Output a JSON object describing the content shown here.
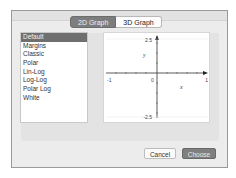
{
  "tabs": [
    {
      "label": "2D Graph",
      "active": true
    },
    {
      "label": "3D Graph",
      "active": false
    }
  ],
  "templates": {
    "selected": "Default",
    "items": [
      "Default",
      "Margins",
      "Classic",
      "Polar",
      "Lin-Log",
      "Log-Log",
      "Polar Log",
      "White"
    ]
  },
  "preview": {
    "x_label": "x",
    "y_label": "y",
    "x_min_label": "-1",
    "x_max_label": "1",
    "origin_label": "0",
    "y_max_label": "2.5",
    "y_min_label": "-2.5"
  },
  "buttons": {
    "cancel": "Cancel",
    "choose": "Choose"
  },
  "colors": {
    "selected_bg": "#6f6f6f",
    "primary_button": "#7f7f7f",
    "dialog_bg": "#ececec"
  }
}
